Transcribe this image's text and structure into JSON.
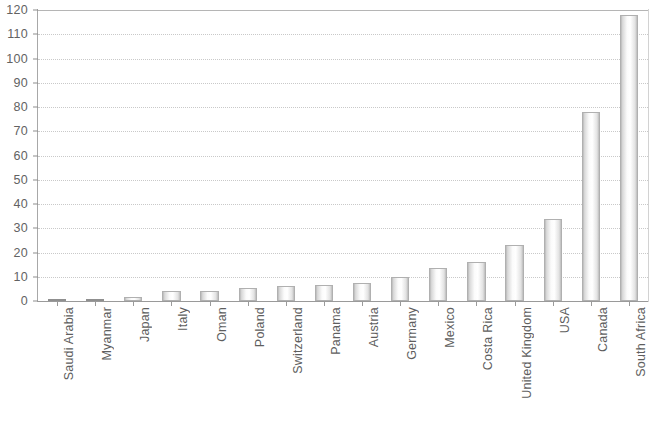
{
  "chart_data": {
    "type": "bar",
    "title": "",
    "subtitle": "",
    "xlabel": "",
    "ylabel": "",
    "ylim": [
      0,
      120
    ],
    "ytick_step": 10,
    "grid": true,
    "legend": null,
    "legend_position": "none",
    "categories": [
      "Saudi Arabia",
      "Myanmar",
      "Japan",
      "Italy",
      "Oman",
      "Poland",
      "Switzerland",
      "Panama",
      "Austria",
      "Germany",
      "Mexico",
      "Costa Rica",
      "United Kingdom",
      "USA",
      "Canada",
      "South Africa"
    ],
    "values": [
      0,
      0,
      1.5,
      4,
      4,
      5.5,
      6,
      6.5,
      7.5,
      10,
      13.5,
      16,
      23,
      34,
      78,
      118
    ],
    "ytick_labels": [
      "120",
      "110",
      "100",
      "90",
      "80",
      "70",
      "60",
      "50",
      "40",
      "30",
      "20",
      "10",
      "0"
    ],
    "ytick_values": [
      120,
      110,
      100,
      90,
      80,
      70,
      60,
      50,
      40,
      30,
      20,
      10,
      0
    ],
    "series": [
      {
        "name": "",
        "values": [
          0,
          0,
          1.5,
          4,
          4,
          5.5,
          6,
          6.5,
          7.5,
          10,
          13.5,
          16,
          23,
          34,
          78,
          118
        ]
      }
    ]
  },
  "style": {
    "bar_border_color": "#b0b0b0",
    "bar_fill_light": "#ffffff",
    "bar_fill_shadow": "#b9b9b9",
    "gridline_color": "#c9c9c9",
    "axis_color": "#9a9a9a",
    "text_color": "#555555",
    "background_color": "#ffffff"
  }
}
